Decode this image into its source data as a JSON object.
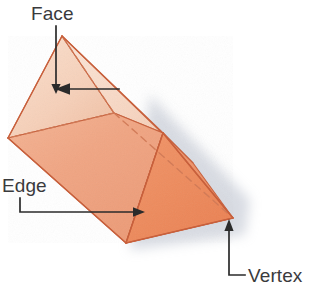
{
  "figure": {
    "shape_name": "triangular-prism",
    "background_color": "#ffffff"
  },
  "labels": {
    "face": "Face",
    "edge": "Edge",
    "vertex": "Vertex"
  },
  "colors": {
    "face_light": "#f8d9c6",
    "face_light_2": "#fbe3d4",
    "face_mid": "#f0a985",
    "face_mid_2": "#efa07c",
    "face_dark": "#ef8f63",
    "face_dark_2": "#ea8257",
    "outline": "#c8603c",
    "hidden_edge": "#d4735180",
    "leader_line": "#2b2b2b",
    "label_text": "#3a3a3c",
    "shadow": "#c9cdd6"
  },
  "geometry": {
    "apex_top": [
      62,
      36
    ],
    "left_vertex": [
      8,
      138
    ],
    "bottom_vertex": [
      126,
      243
    ],
    "right_vertex": [
      233,
      218
    ],
    "front_top_vertex": [
      163,
      133
    ],
    "hidden_vertex": [
      114,
      113
    ]
  },
  "annotations": [
    {
      "name": "face-annotation",
      "label": "Face",
      "points_to": "top-rear-rectangular-face",
      "arrow_direction": "down"
    },
    {
      "name": "edge-annotation",
      "label": "Edge",
      "points_to": "front-lower-edge",
      "arrow_direction": "right"
    },
    {
      "name": "vertex-annotation",
      "label": "Vertex",
      "points_to": "right-corner-vertex",
      "arrow_direction": "up"
    }
  ]
}
